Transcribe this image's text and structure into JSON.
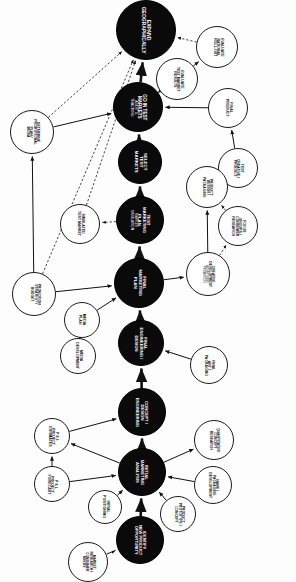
{
  "diagram": {
    "orientation": "rotated-90",
    "colors": {
      "major_fill": "#0a0a0a",
      "major_text": "#ffffff",
      "minor_fill": "#ffffff",
      "minor_text": "#0c0c0c",
      "edge": "#111111",
      "background": "#fdfdfd"
    },
    "legend": {
      "major": "Milestone / decision stage",
      "minor": "Supporting activity",
      "solid_edge": "Primary sequence",
      "dashed_edge": "Feedback / information flow"
    },
    "nodes": [
      {
        "id": "expand-geographically",
        "type": "major",
        "x": 116,
        "y": 0,
        "d": 60,
        "fs": 5.0,
        "lines": [
          "EXPAND",
          "GEOGRAPHICALLY"
        ]
      },
      {
        "id": "evaluate-national-roll-out",
        "type": "minor",
        "x": 196,
        "y": 26,
        "d": 42,
        "fs": 3.5,
        "lines": [
          "EVALUATE",
          "NATIONAL",
          "ROLL-OUT"
        ]
      },
      {
        "id": "evaluate-test-market-results",
        "type": "minor",
        "x": 156,
        "y": 58,
        "d": 42,
        "fs": 3.5,
        "lines": [
          "EVALUATE",
          "TEST MARKET",
          "RESULTS"
        ]
      },
      {
        "id": "go-in-test-markets",
        "type": "major",
        "x": 113,
        "y": 82,
        "d": 50,
        "fs": 4.6,
        "lines": [
          "GO IN TEST",
          "MARKETS"
        ],
        "sublines": [
          "AUDIT &",
          "TRACKING"
        ]
      },
      {
        "id": "final-product",
        "type": "minor",
        "x": 208,
        "y": 88,
        "d": 40,
        "fs": 3.6,
        "lines": [
          "FINAL",
          "PRODUCT"
        ]
      },
      {
        "id": "determine-promotional-plan-media",
        "type": "minor",
        "x": 10,
        "y": 110,
        "d": 44,
        "fs": 3.4,
        "lines": [
          "DETERMINE",
          "PROMOTIONAL",
          "PLAN /",
          "MEDIA"
        ]
      },
      {
        "id": "select-test-markets",
        "type": "major",
        "x": 118,
        "y": 140,
        "d": 44,
        "fs": 4.4,
        "lines": [
          "SELECT",
          "TEST",
          "MARKETS"
        ]
      },
      {
        "id": "test-creative-product",
        "type": "minor",
        "x": 218,
        "y": 148,
        "d": 40,
        "fs": 3.5,
        "lines": [
          "TEST",
          "CREATIVE /",
          "PRODUCT"
        ]
      },
      {
        "id": "product-design-packaging",
        "type": "minor",
        "x": 186,
        "y": 166,
        "d": 42,
        "fs": 3.4,
        "lines": [
          "PRODUCT",
          "DESIGN /",
          "PACKAGING"
        ]
      },
      {
        "id": "test-marketing-plan",
        "type": "major",
        "x": 116,
        "y": 196,
        "d": 48,
        "fs": 4.3,
        "lines": [
          "TEST",
          "MARKETING",
          "PLAN"
        ],
        "sublines": [
          "MARKET",
          "SIMULATION"
        ]
      },
      {
        "id": "simulated-test-market",
        "type": "minor",
        "x": 60,
        "y": 204,
        "d": 40,
        "fs": 3.5,
        "lines": [
          "SIMULATED",
          "TEST MARKET"
        ]
      },
      {
        "id": "focus-groups",
        "type": "minor",
        "x": 218,
        "y": 206,
        "d": 40,
        "fs": 3.5,
        "lines": [
          "FOCUS",
          "GROUPS /",
          "CONSUMER",
          "RESEARCH"
        ]
      },
      {
        "id": "creative-development",
        "type": "minor",
        "x": 186,
        "y": 252,
        "d": 44,
        "fs": 3.4,
        "lines": [
          "CREATIVE",
          "DEVELOPMENT"
        ],
        "sublines": [
          "ADVERTISING",
          "PROMOTION"
        ]
      },
      {
        "id": "final-marketing-plan",
        "type": "major",
        "x": 114,
        "y": 258,
        "d": 50,
        "fs": 4.4,
        "lines": [
          "FINAL",
          "MARKETING",
          "PLAN"
        ]
      },
      {
        "id": "promotion-strategy",
        "type": "minor",
        "x": 12,
        "y": 272,
        "d": 44,
        "fs": 3.4,
        "lines": [
          "PROMOTION",
          "STRATEGY /",
          "BUDGET"
        ]
      },
      {
        "id": "media-plan",
        "type": "minor",
        "x": 64,
        "y": 302,
        "d": 36,
        "fs": 3.6,
        "lines": [
          "MEDIA",
          "PLAN"
        ]
      },
      {
        "id": "final-engineering-design",
        "type": "major",
        "x": 118,
        "y": 320,
        "d": 46,
        "fs": 4.2,
        "lines": [
          "FINAL",
          "ENGINEERING /",
          "DESIGN"
        ]
      },
      {
        "id": "media-development",
        "type": "minor",
        "x": 60,
        "y": 338,
        "d": 36,
        "fs": 3.5,
        "lines": [
          "MEDIA",
          "DEVELOPMENT"
        ]
      },
      {
        "id": "final-art-packaging",
        "type": "minor",
        "x": 190,
        "y": 346,
        "d": 38,
        "fs": 3.5,
        "lines": [
          "FINAL",
          "ART /",
          "PACKAGING"
        ]
      },
      {
        "id": "concept-design-engineering",
        "type": "major",
        "x": 118,
        "y": 388,
        "d": 48,
        "fs": 4.2,
        "lines": [
          "CONCEPT /",
          "DESIGN",
          "ENGINEERING"
        ]
      },
      {
        "id": "pl-project-estimates",
        "type": "minor",
        "x": 34,
        "y": 418,
        "d": 36,
        "fs": 3.6,
        "lines": [
          "P & L",
          "PROJECT",
          "ESTIMATES"
        ]
      },
      {
        "id": "quantitative-concept-research",
        "type": "minor",
        "x": 194,
        "y": 420,
        "d": 40,
        "fs": 3.4,
        "lines": [
          "QUANTITATIVE",
          "CONCEPT",
          "RESEARCH"
        ]
      },
      {
        "id": "initial-marketing-analysis",
        "type": "major",
        "x": 118,
        "y": 448,
        "d": 48,
        "fs": 4.2,
        "lines": [
          "INITIAL",
          "MARKETING",
          "ANALYSIS"
        ]
      },
      {
        "id": "pl-project-forecast",
        "type": "minor",
        "x": 34,
        "y": 466,
        "d": 36,
        "fs": 3.6,
        "lines": [
          "P & L",
          "PROJECT",
          "FORECAST"
        ]
      },
      {
        "id": "initial-positioning",
        "type": "minor",
        "x": 88,
        "y": 490,
        "d": 34,
        "fs": 3.5,
        "lines": [
          "INITIAL",
          "POSITIONING"
        ]
      },
      {
        "id": "product-prototype-concept",
        "type": "minor",
        "x": 160,
        "y": 496,
        "d": 36,
        "fs": 3.4,
        "lines": [
          "PRODUCT",
          "PROTOTYPE /",
          "CONCEPT"
        ]
      },
      {
        "id": "name-packaging-development",
        "type": "minor",
        "x": 194,
        "y": 466,
        "d": 38,
        "fs": 3.4,
        "lines": [
          "NAME /",
          "PACKAGING",
          "DEVELOPMENT"
        ]
      },
      {
        "id": "identify-opportunity",
        "type": "major",
        "x": 116,
        "y": 516,
        "d": 48,
        "fs": 4.0,
        "lines": [
          "IDENTIFY",
          "NEW PRODUCT",
          "OPPORTUNITY"
        ]
      },
      {
        "id": "market-research-consumer-needs",
        "type": "minor",
        "x": 68,
        "y": 542,
        "d": 40,
        "fs": 3.3,
        "lines": [
          "MARKET",
          "RESEARCH /",
          "CONSUMER",
          "NEEDS"
        ]
      }
    ],
    "edges": [
      {
        "from": "identify-opportunity",
        "to": "initial-marketing-analysis",
        "style": "solid",
        "weight": "heavy"
      },
      {
        "from": "market-research-consumer-needs",
        "to": "identify-opportunity",
        "style": "solid",
        "weight": "normal"
      },
      {
        "from": "initial-positioning",
        "to": "initial-marketing-analysis",
        "style": "solid",
        "weight": "normal"
      },
      {
        "from": "product-prototype-concept",
        "to": "initial-marketing-analysis",
        "style": "solid",
        "weight": "normal"
      },
      {
        "from": "name-packaging-development",
        "to": "initial-marketing-analysis",
        "style": "solid",
        "weight": "normal"
      },
      {
        "from": "pl-project-forecast",
        "to": "initial-marketing-analysis",
        "style": "solid",
        "weight": "normal"
      },
      {
        "from": "pl-project-forecast",
        "to": "pl-project-estimates",
        "style": "solid",
        "weight": "normal"
      },
      {
        "from": "initial-marketing-analysis",
        "to": "pl-project-estimates",
        "style": "solid",
        "weight": "normal"
      },
      {
        "from": "initial-marketing-analysis",
        "to": "quantitative-concept-research",
        "style": "solid",
        "weight": "normal"
      },
      {
        "from": "initial-marketing-analysis",
        "to": "concept-design-engineering",
        "style": "solid",
        "weight": "heavy"
      },
      {
        "from": "pl-project-estimates",
        "to": "concept-design-engineering",
        "style": "solid",
        "weight": "normal"
      },
      {
        "from": "final-art-packaging",
        "to": "final-engineering-design",
        "style": "solid",
        "weight": "normal"
      },
      {
        "from": "concept-design-engineering",
        "to": "final-engineering-design",
        "style": "solid",
        "weight": "heavy"
      },
      {
        "from": "media-development",
        "to": "media-plan",
        "style": "solid",
        "weight": "normal"
      },
      {
        "from": "media-plan",
        "to": "final-marketing-plan",
        "style": "solid",
        "weight": "normal"
      },
      {
        "from": "final-engineering-design",
        "to": "final-marketing-plan",
        "style": "solid",
        "weight": "heavy"
      },
      {
        "from": "promotion-strategy",
        "to": "final-marketing-plan",
        "style": "solid",
        "weight": "normal"
      },
      {
        "from": "final-marketing-plan",
        "to": "creative-development",
        "style": "solid",
        "weight": "normal"
      },
      {
        "from": "final-marketing-plan",
        "to": "test-marketing-plan",
        "style": "solid",
        "weight": "heavy"
      },
      {
        "from": "creative-development",
        "to": "product-design-packaging",
        "style": "solid",
        "weight": "normal"
      },
      {
        "from": "creative-development",
        "to": "focus-groups",
        "style": "dashed",
        "weight": "normal"
      },
      {
        "from": "focus-groups",
        "to": "product-design-packaging",
        "style": "dashed",
        "weight": "normal"
      },
      {
        "from": "product-design-packaging",
        "to": "test-creative-product",
        "style": "solid",
        "weight": "normal"
      },
      {
        "from": "test-creative-product",
        "to": "final-product",
        "style": "solid",
        "weight": "normal"
      },
      {
        "from": "test-marketing-plan",
        "to": "simulated-test-market",
        "style": "dashed",
        "weight": "normal"
      },
      {
        "from": "test-marketing-plan",
        "to": "select-test-markets",
        "style": "solid",
        "weight": "heavy"
      },
      {
        "from": "final-product",
        "to": "go-in-test-markets",
        "style": "solid",
        "weight": "normal"
      },
      {
        "from": "determine-promotional-plan-media",
        "to": "go-in-test-markets",
        "style": "solid",
        "weight": "normal"
      },
      {
        "from": "promotion-strategy",
        "to": "determine-promotional-plan-media",
        "style": "solid",
        "weight": "normal"
      },
      {
        "from": "select-test-markets",
        "to": "go-in-test-markets",
        "style": "solid",
        "weight": "heavy"
      },
      {
        "from": "go-in-test-markets",
        "to": "expand-geographically",
        "style": "solid",
        "weight": "heavy"
      },
      {
        "from": "go-in-test-markets",
        "to": "evaluate-test-market-results",
        "style": "solid",
        "weight": "normal"
      },
      {
        "from": "evaluate-test-market-results",
        "to": "evaluate-national-roll-out",
        "style": "solid",
        "weight": "normal"
      },
      {
        "from": "evaluate-national-roll-out",
        "to": "expand-geographically",
        "style": "dashed",
        "weight": "normal"
      },
      {
        "from": "determine-promotional-plan-media",
        "to": "expand-geographically",
        "style": "dashed",
        "weight": "normal"
      },
      {
        "from": "simulated-test-market",
        "to": "expand-geographically",
        "style": "dashed",
        "weight": "normal"
      },
      {
        "from": "promotion-strategy",
        "to": "expand-geographically",
        "style": "dashed",
        "weight": "normal"
      }
    ]
  }
}
